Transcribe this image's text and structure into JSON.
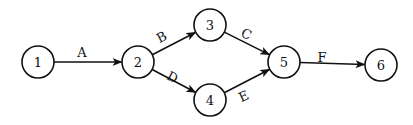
{
  "diagram": {
    "type": "activity-on-arrow network",
    "colors": {
      "stroke": "#111111",
      "background": "#ffffff"
    },
    "nodes": [
      {
        "id": "1",
        "label": "1",
        "x": 38,
        "y": 62,
        "r": 16
      },
      {
        "id": "2",
        "label": "2",
        "x": 138,
        "y": 62,
        "r": 16
      },
      {
        "id": "3",
        "label": "3",
        "x": 210,
        "y": 25,
        "r": 16
      },
      {
        "id": "4",
        "label": "4",
        "x": 210,
        "y": 100,
        "r": 16
      },
      {
        "id": "5",
        "label": "5",
        "x": 284,
        "y": 62,
        "r": 16
      },
      {
        "id": "6",
        "label": "6",
        "x": 381,
        "y": 65,
        "r": 16
      }
    ],
    "edges": [
      {
        "id": "A",
        "label": "A",
        "from": "1",
        "to": "2",
        "lx": 82,
        "ly": 53,
        "rot": 0
      },
      {
        "id": "B",
        "label": "B",
        "from": "2",
        "to": "3",
        "lx": 162,
        "ly": 38,
        "rot": -28
      },
      {
        "id": "D",
        "label": "D",
        "from": "2",
        "to": "4",
        "lx": 172,
        "ly": 78,
        "rot": 28
      },
      {
        "id": "C",
        "label": "C",
        "from": "3",
        "to": "5",
        "lx": 246,
        "ly": 35,
        "rot": 25
      },
      {
        "id": "E",
        "label": "E",
        "from": "4",
        "to": "5",
        "lx": 244,
        "ly": 97,
        "rot": -25
      },
      {
        "id": "F",
        "label": "F",
        "from": "5",
        "to": "6",
        "lx": 322,
        "ly": 58,
        "rot": 0
      }
    ]
  }
}
